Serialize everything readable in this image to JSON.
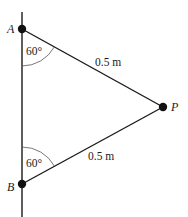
{
  "diagram": {
    "type": "geometry",
    "colors": {
      "line": "#1a1a1a",
      "arc": "#555555",
      "text": "#1a1a1a",
      "background": "#ffffff"
    },
    "points": {
      "A": {
        "label": "A",
        "x": 22,
        "y": 29
      },
      "B": {
        "label": "B",
        "x": 22,
        "y": 184
      },
      "P": {
        "label": "P",
        "x": 163,
        "y": 107
      }
    },
    "vertical_line": {
      "x": 22,
      "y_top": 12,
      "y_bottom": 217
    },
    "segments": [
      {
        "from": "A",
        "to": "P",
        "length_label": "0.5 m"
      },
      {
        "from": "B",
        "to": "P",
        "length_label": "0.5 m"
      }
    ],
    "angles": [
      {
        "at": "A",
        "between": "vertical-down and AP",
        "label": "60°"
      },
      {
        "at": "B",
        "between": "vertical-up and BP",
        "label": "60°"
      }
    ]
  }
}
